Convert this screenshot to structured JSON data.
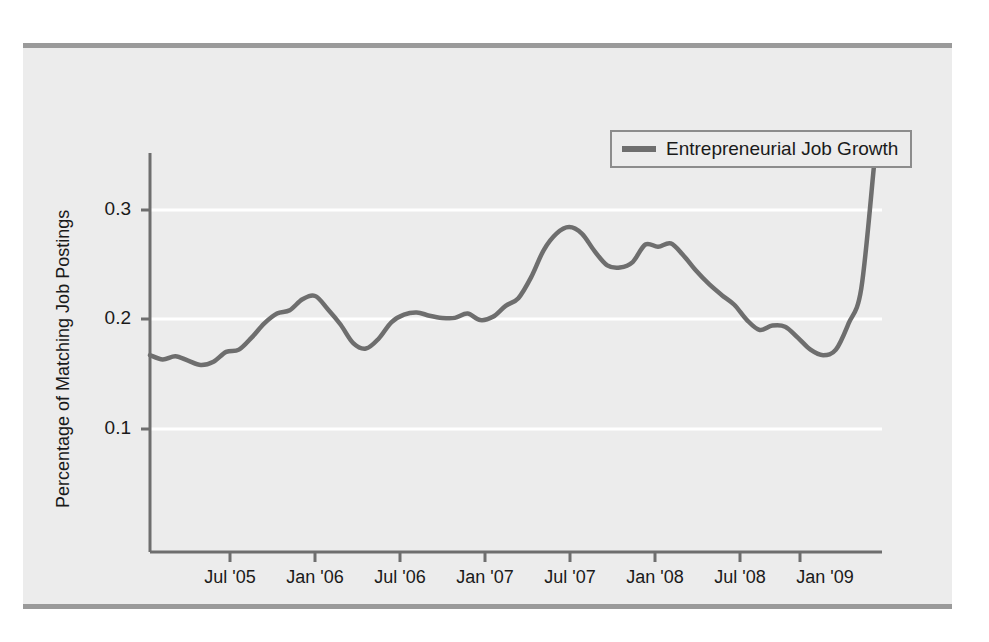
{
  "figure": {
    "background_color": "#ffffff",
    "panel_color": "#ececec",
    "rule_color": "#9a9a9a",
    "line_color": "#6e6e6e",
    "gridline_color": "#ffffff",
    "axis_color": "#6e6e6e"
  },
  "legend": {
    "entries": [
      {
        "label": "Entrepreneurial Job Growth",
        "color": "#6e6e6e"
      }
    ]
  },
  "axes": {
    "y_title": "Percentage of Matching Job Postings",
    "y_ticks": [
      "0.1",
      "0.2",
      "0.3"
    ],
    "x_ticks": [
      "Jul '05",
      "Jan '06",
      "Jul '06",
      "Jan '07",
      "Jul '07",
      "Jan '08",
      "Jul '08",
      "Jan '09"
    ]
  },
  "chart_data": {
    "type": "line",
    "title": "",
    "subtitle": "",
    "xlabel": "",
    "ylabel": "Percentage of Matching Job Postings",
    "grid": true,
    "legend_position": "top-right",
    "xlim": [
      "2005-01",
      "2009-10"
    ],
    "ylim": [
      0.0,
      0.36
    ],
    "y_ticks": [
      0.1,
      0.2,
      0.3
    ],
    "x_tick_labels": [
      "Jul '05",
      "Jan '06",
      "Jul '06",
      "Jan '07",
      "Jul '07",
      "Jan '08",
      "Jul '08",
      "Jan '09"
    ],
    "x_tick_positions": [
      "2005-07",
      "2006-01",
      "2006-07",
      "2007-01",
      "2007-07",
      "2008-01",
      "2008-07",
      "2009-01"
    ],
    "series": [
      {
        "name": "Entrepreneurial Job Growth",
        "color": "#6e6e6e",
        "x": [
          "2005-01",
          "2005-02",
          "2005-03",
          "2005-04",
          "2005-05",
          "2005-06",
          "2005-07",
          "2005-08",
          "2005-09",
          "2005-10",
          "2005-11",
          "2005-12",
          "2006-01",
          "2006-02",
          "2006-03",
          "2006-04",
          "2006-05",
          "2006-06",
          "2006-07",
          "2006-08",
          "2006-09",
          "2006-10",
          "2006-11",
          "2006-12",
          "2007-01",
          "2007-02",
          "2007-03",
          "2007-04",
          "2007-05",
          "2007-06",
          "2007-07",
          "2007-08",
          "2007-09",
          "2007-10",
          "2007-11",
          "2007-12",
          "2008-01",
          "2008-02",
          "2008-03",
          "2008-04",
          "2008-05",
          "2008-06",
          "2008-07",
          "2008-08",
          "2008-09",
          "2008-10",
          "2008-11",
          "2008-12",
          "2009-01",
          "2009-02",
          "2009-03",
          "2009-04",
          "2009-05",
          "2009-06",
          "2009-07",
          "2009-08",
          "2009-09",
          "2009-10"
        ],
        "values": [
          0.167,
          0.163,
          0.166,
          0.162,
          0.158,
          0.161,
          0.17,
          0.172,
          0.183,
          0.196,
          0.205,
          0.208,
          0.218,
          0.221,
          0.209,
          0.195,
          0.178,
          0.173,
          0.182,
          0.197,
          0.204,
          0.206,
          0.203,
          0.201,
          0.201,
          0.205,
          0.199,
          0.202,
          0.212,
          0.219,
          0.238,
          0.263,
          0.278,
          0.284,
          0.278,
          0.262,
          0.249,
          0.247,
          0.252,
          0.268,
          0.266,
          0.269,
          0.258,
          0.244,
          0.232,
          0.222,
          0.213,
          0.199,
          0.19,
          0.194,
          0.193,
          0.183,
          0.172,
          0.167,
          0.172,
          0.196,
          0.228,
          0.34
        ]
      }
    ],
    "annotations": {
      "peak_value": 0.284,
      "peak_x": "2007-10",
      "final_value": 0.34,
      "final_x": "2009-10",
      "min_value": 0.158,
      "min_x": "2005-05"
    }
  }
}
